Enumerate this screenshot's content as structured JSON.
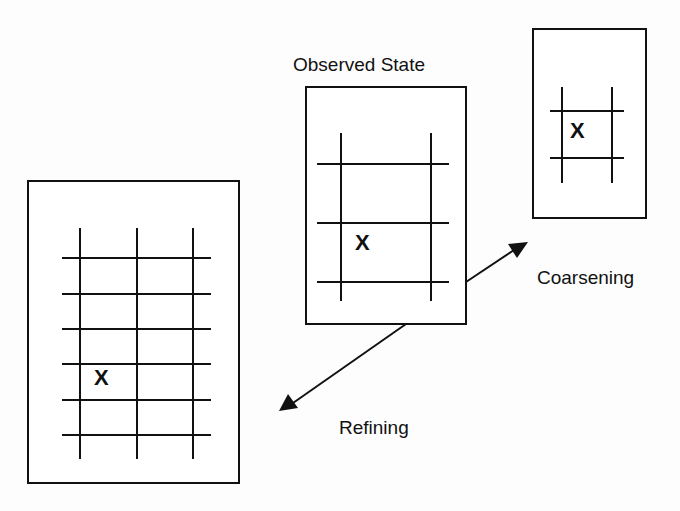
{
  "diagram": {
    "labels": {
      "observed": "Observed State",
      "coarsening": "Coarsening",
      "refining": "Refining"
    },
    "marker": "X",
    "panels": [
      {
        "id": "refined",
        "description": "fine grid: 3 vertical x 6 horizontal lines",
        "vertical_lines": 3,
        "horizontal_lines": 6
      },
      {
        "id": "observed",
        "description": "observed grid: 2 vertical x 3 horizontal lines",
        "vertical_lines": 2,
        "horizontal_lines": 3
      },
      {
        "id": "coarsened",
        "description": "coarse grid: 2 vertical x 2 horizontal lines",
        "vertical_lines": 2,
        "horizontal_lines": 2
      }
    ],
    "arrows": [
      {
        "from": "observed",
        "to": "coarsened",
        "label": "Coarsening"
      },
      {
        "from": "observed",
        "to": "refined",
        "label": "Refining"
      }
    ],
    "colors": {
      "ink": "#111111",
      "background": "#fdfdfd"
    }
  }
}
